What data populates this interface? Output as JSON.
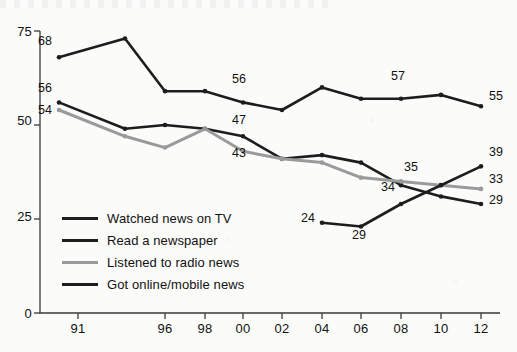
{
  "chart_data": {
    "type": "line",
    "title": "",
    "subtitle": "",
    "xlabel": "",
    "ylabel": "",
    "xlim": [
      1990,
      2012
    ],
    "ylim": [
      0,
      75
    ],
    "yticks": [
      "0",
      "25",
      "50",
      "75"
    ],
    "ytick_values": [
      0,
      25,
      50,
      75
    ],
    "grid": false,
    "legend_position": "inside-lower-left",
    "x": [
      1990,
      1993,
      1996,
      1998,
      2000,
      2002,
      2004,
      2006,
      2008,
      2010,
      2012
    ],
    "xtick_labels": [
      "91",
      "96",
      "98",
      "00",
      "02",
      "04",
      "06",
      "08",
      "10",
      "12"
    ],
    "xtick_values": [
      1991,
      1996,
      1998,
      2000,
      2002,
      2004,
      2006,
      2008,
      2010,
      2012
    ],
    "series": [
      {
        "name": "Watched news on TV",
        "color": "#1d1d1d",
        "values": [
          68,
          73,
          59,
          59,
          56,
          54,
          60,
          57,
          57,
          58,
          55
        ],
        "point_labels": [
          {
            "x": 1990,
            "value": 68,
            "text": "68"
          },
          {
            "x": 2000,
            "value": 56,
            "text": "56"
          },
          {
            "x": 2008,
            "value": 57,
            "text": "57"
          },
          {
            "x": 2012,
            "value": 55,
            "text": "55"
          }
        ]
      },
      {
        "name": "Read a newspaper",
        "color": "#1d1d1d",
        "values": [
          56,
          49,
          50,
          49,
          47,
          41,
          42,
          40,
          34,
          31,
          29
        ],
        "point_labels": [
          {
            "x": 1990,
            "value": 56,
            "text": "56"
          },
          {
            "x": 2000,
            "value": 47,
            "text": "47"
          },
          {
            "x": 2008,
            "value": 34,
            "text": "34"
          },
          {
            "x": 2012,
            "value": 29,
            "text": "29"
          }
        ]
      },
      {
        "name": "Listened to radio news",
        "color": "#9a9a9a",
        "values": [
          54,
          47,
          44,
          49,
          43,
          41,
          40,
          36,
          35,
          34,
          33
        ],
        "point_labels": [
          {
            "x": 1990,
            "value": 54,
            "text": "54"
          },
          {
            "x": 2000,
            "value": 43,
            "text": "43"
          },
          {
            "x": 2008,
            "value": 35,
            "text": "35"
          },
          {
            "x": 2012,
            "value": 33,
            "text": "33"
          }
        ]
      },
      {
        "name": "Got online/mobile news",
        "color": "#1d1d1d",
        "values": [
          null,
          null,
          null,
          null,
          null,
          null,
          24,
          23,
          29,
          34,
          39
        ],
        "point_labels": [
          {
            "x": 2004,
            "value": 24,
            "text": "24"
          },
          {
            "x": 2006,
            "value": 23,
            "text": "29"
          },
          {
            "x": 2012,
            "value": 39,
            "text": "39"
          }
        ]
      }
    ]
  },
  "legend": {
    "items": [
      {
        "label": "Watched news on TV",
        "color": "#1d1d1d",
        "width": 3.6
      },
      {
        "label": "Read a newspaper",
        "color": "#1d1d1d",
        "width": 3.6
      },
      {
        "label": "Listened to radio news",
        "color": "#9a9a9a",
        "width": 3.2
      },
      {
        "label": "Got online/mobile news",
        "color": "#1d1d1d",
        "width": 3.6
      }
    ]
  },
  "axes": {
    "y_ticks": [
      "75",
      "50",
      "25",
      "0"
    ],
    "x_ticks": [
      "91",
      "96",
      "98",
      "00",
      "02",
      "04",
      "06",
      "08",
      "10",
      "12"
    ]
  }
}
